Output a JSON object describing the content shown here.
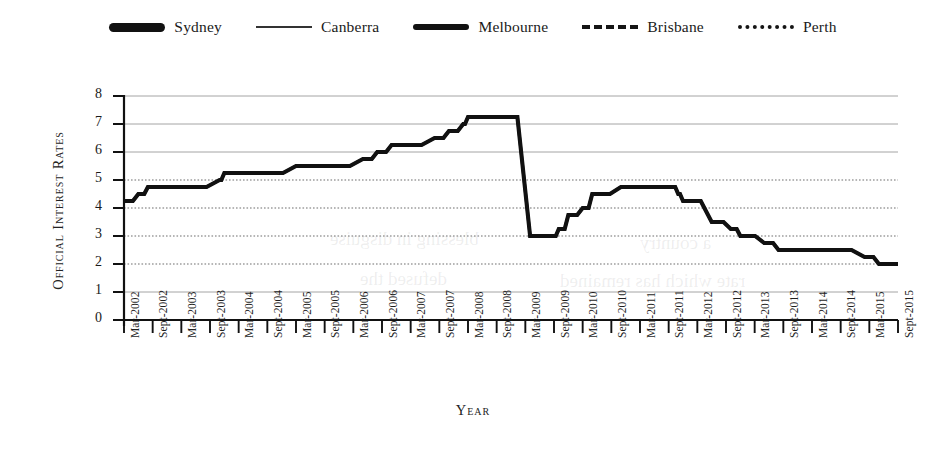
{
  "chart_data": {
    "type": "line",
    "title": "",
    "xlabel": "Year",
    "ylabel": "Official Interest Rates",
    "ylim": [
      0,
      8
    ],
    "ytick_values": [
      0,
      1,
      2,
      3,
      4,
      5,
      6,
      7,
      8
    ],
    "grid": true,
    "legend_position": "top-center",
    "note": "All five series trace the identical national official cash rate, so only one line is visible.",
    "categories": [
      "Mar-2002",
      "Sept-2002",
      "Mar-2003",
      "Sept-2003",
      "Mar-2004",
      "Sept-2004",
      "Mar-2005",
      "Sept-2005",
      "Mar-2006",
      "Sept-2006",
      "Mar-2007",
      "Sept-2007",
      "Mar-2008",
      "Sept-2008",
      "Mar-2009",
      "Sept-2009",
      "Mar-2010",
      "Sept-2010",
      "Mar-2011",
      "Sept-2011",
      "Mar-2012",
      "Sept-2012",
      "Mar-2013",
      "Sept-2013",
      "Mar-2014",
      "Sept-2014",
      "Mar-2015",
      "Sept-2015"
    ],
    "x_tick_labels": [
      "Mar-2002",
      "Sept-2002",
      "Mar-2003",
      "Sept-2003",
      "Mar-2004",
      "Sept-2004",
      "Mar-2005",
      "Sept-2005",
      "Mar-2006",
      "Sept-2006",
      "Mar-2007",
      "Sept-2007",
      "Mar-2008",
      "Sept-2008",
      "Mar-2009",
      "Sept-2009",
      "Mar-2010",
      "Sept-2010",
      "Mar-2011",
      "Sept-2011",
      "Mar-2012",
      "Sept-2012",
      "Mar-2013",
      "Sept-2013",
      "Mar-2014",
      "Sept-2014",
      "Mar-2015",
      "Sept-2015"
    ],
    "series": [
      {
        "name": "Sydney",
        "style": "thick-solid",
        "color": "#111111",
        "values": [
          4.25,
          4.75,
          4.75,
          4.75,
          5.25,
          5.25,
          5.5,
          5.5,
          5.5,
          6.0,
          6.25,
          6.5,
          7.25,
          7.25,
          3.0,
          3.0,
          4.0,
          4.5,
          4.75,
          4.75,
          4.25,
          3.5,
          3.0,
          2.5,
          2.5,
          2.5,
          2.25,
          2.0
        ]
      },
      {
        "name": "Canberra",
        "style": "thin-solid",
        "color": "#333333",
        "values": [
          4.25,
          4.75,
          4.75,
          4.75,
          5.25,
          5.25,
          5.5,
          5.5,
          5.5,
          6.0,
          6.25,
          6.5,
          7.25,
          7.25,
          3.0,
          3.0,
          4.0,
          4.5,
          4.75,
          4.75,
          4.25,
          3.5,
          3.0,
          2.5,
          2.5,
          2.5,
          2.25,
          2.0
        ]
      },
      {
        "name": "Melbourne",
        "style": "medium-thick-solid",
        "color": "#111111",
        "values": [
          4.25,
          4.75,
          4.75,
          4.75,
          5.25,
          5.25,
          5.5,
          5.5,
          5.5,
          6.0,
          6.25,
          6.5,
          7.25,
          7.25,
          3.0,
          3.0,
          4.0,
          4.5,
          4.75,
          4.75,
          4.25,
          3.5,
          3.0,
          2.5,
          2.5,
          2.5,
          2.25,
          2.0
        ]
      },
      {
        "name": "Brisbane",
        "style": "dashed",
        "color": "#151515",
        "values": [
          4.25,
          4.75,
          4.75,
          4.75,
          5.25,
          5.25,
          5.5,
          5.5,
          5.5,
          6.0,
          6.25,
          6.5,
          7.25,
          7.25,
          3.0,
          3.0,
          4.0,
          4.5,
          4.75,
          4.75,
          4.25,
          3.5,
          3.0,
          2.5,
          2.5,
          2.5,
          2.25,
          2.0
        ]
      },
      {
        "name": "Perth",
        "style": "dotted",
        "color": "#151515",
        "values": [
          4.25,
          4.75,
          4.75,
          4.75,
          5.25,
          5.25,
          5.5,
          5.5,
          5.5,
          6.0,
          6.25,
          6.5,
          7.25,
          7.25,
          3.0,
          3.0,
          4.0,
          4.5,
          4.75,
          4.75,
          4.25,
          3.5,
          3.0,
          2.5,
          2.5,
          2.5,
          2.25,
          2.0
        ]
      }
    ],
    "detailed_step_path": [
      {
        "x": "Mar-2002",
        "v": 4.25
      },
      {
        "x": "Jun-2002",
        "v": 4.5
      },
      {
        "x": "Aug-2002",
        "v": 4.75
      },
      {
        "x": "Nov-2003",
        "v": 5.0
      },
      {
        "x": "Dec-2003",
        "v": 5.25
      },
      {
        "x": "Mar-2005",
        "v": 5.5
      },
      {
        "x": "May-2006",
        "v": 5.75
      },
      {
        "x": "Aug-2006",
        "v": 6.0
      },
      {
        "x": "Nov-2006",
        "v": 6.25
      },
      {
        "x": "Aug-2007",
        "v": 6.5
      },
      {
        "x": "Nov-2007",
        "v": 6.75
      },
      {
        "x": "Feb-2008",
        "v": 7.0
      },
      {
        "x": "Mar-2008",
        "v": 7.25
      },
      {
        "x": "Sept-2008",
        "v": 7.25
      },
      {
        "x": "Apr-2009",
        "v": 3.0
      },
      {
        "x": "Sept-2009",
        "v": 3.0
      },
      {
        "x": "Oct-2009",
        "v": 3.25
      },
      {
        "x": "Dec-2009",
        "v": 3.75
      },
      {
        "x": "Mar-2010",
        "v": 4.0
      },
      {
        "x": "May-2010",
        "v": 4.5
      },
      {
        "x": "Nov-2010",
        "v": 4.75
      },
      {
        "x": "Oct-2011",
        "v": 4.75
      },
      {
        "x": "Nov-2011",
        "v": 4.5
      },
      {
        "x": "Dec-2011",
        "v": 4.25
      },
      {
        "x": "Jun-2012",
        "v": 3.5
      },
      {
        "x": "Oct-2012",
        "v": 3.25
      },
      {
        "x": "Dec-2012",
        "v": 3.0
      },
      {
        "x": "May-2013",
        "v": 2.75
      },
      {
        "x": "Aug-2013",
        "v": 2.5
      },
      {
        "x": "Feb-2015",
        "v": 2.25
      },
      {
        "x": "May-2015",
        "v": 2.0
      },
      {
        "x": "Sept-2015",
        "v": 2.0
      }
    ]
  },
  "legend": {
    "entries": [
      {
        "label": "Sydney",
        "swatch": "thick-solid-line-swatch"
      },
      {
        "label": "Canberra",
        "swatch": "thin-solid-line-swatch"
      },
      {
        "label": "Melbourne",
        "swatch": "medium-thick-solid-line-swatch"
      },
      {
        "label": "Brisbane",
        "swatch": "dashed-line-swatch"
      },
      {
        "label": "Perth",
        "swatch": "dotted-line-swatch"
      }
    ]
  },
  "axes": {
    "y_title": "Official Interest Rates",
    "x_title": "Year",
    "y_ticks": [
      "8",
      "7",
      "6",
      "5",
      "4",
      "3",
      "2",
      "1",
      "0"
    ]
  },
  "ghost_text": {
    "a": "blessing in disguise",
    "b": "defused the",
    "c": "a country",
    "d": "rate which has remained"
  }
}
